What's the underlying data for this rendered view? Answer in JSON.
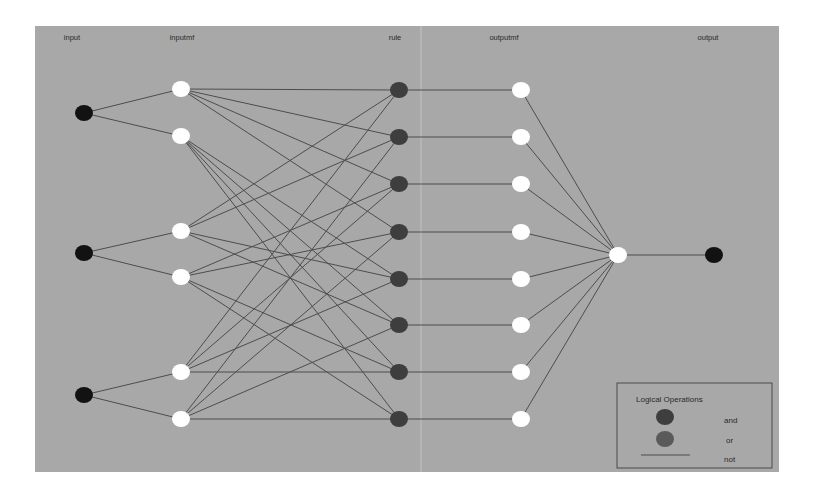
{
  "figure": {
    "background": "#ffffff",
    "panel": {
      "x": 35,
      "y": 26,
      "width": 744,
      "height": 446,
      "color": "#a8a8a8"
    },
    "edge_color": "#4d4d4d",
    "colors": {
      "input_node": "#121212",
      "mf_node": "#ffffff",
      "rule_and": "#3e3e3e",
      "rule_or": "#5a5a5a",
      "sum_node": "#ffffff",
      "output_node": "#121212"
    },
    "node_rx": 9,
    "node_ry": 8
  },
  "layers": [
    {
      "key": "input",
      "label": "input",
      "label_x": 72,
      "x": 84
    },
    {
      "key": "inputmf",
      "label": "inputmf",
      "label_x": 182,
      "x": 181
    },
    {
      "key": "rule",
      "label": "rule",
      "label_x": 395,
      "x": 399
    },
    {
      "key": "outputmf",
      "label": "outputmf",
      "label_x": 504,
      "x": 521
    },
    {
      "key": "output",
      "label": "output",
      "label_x": 708,
      "x": 714
    }
  ],
  "nodes": {
    "input": [
      {
        "id": "in1",
        "y": 113
      },
      {
        "id": "in2",
        "y": 253
      },
      {
        "id": "in3",
        "y": 395
      }
    ],
    "inputmf": [
      {
        "id": "in1mf1",
        "input": 0,
        "y": 89
      },
      {
        "id": "in1mf2",
        "input": 0,
        "y": 136
      },
      {
        "id": "in2mf1",
        "input": 1,
        "y": 231
      },
      {
        "id": "in2mf2",
        "input": 1,
        "y": 277
      },
      {
        "id": "in3mf1",
        "input": 2,
        "y": 372
      },
      {
        "id": "in3mf2",
        "input": 2,
        "y": 419
      }
    ],
    "rule": [
      {
        "id": "rule1",
        "y": 90,
        "mfs": [
          0,
          2,
          4
        ]
      },
      {
        "id": "rule2",
        "y": 137,
        "mfs": [
          0,
          2,
          5
        ]
      },
      {
        "id": "rule3",
        "y": 184,
        "mfs": [
          0,
          3,
          4
        ]
      },
      {
        "id": "rule4",
        "y": 232,
        "mfs": [
          0,
          3,
          5
        ]
      },
      {
        "id": "rule5",
        "y": 279,
        "mfs": [
          1,
          2,
          4
        ]
      },
      {
        "id": "rule6",
        "y": 325,
        "mfs": [
          1,
          2,
          5
        ]
      },
      {
        "id": "rule7",
        "y": 372,
        "mfs": [
          1,
          3,
          4
        ]
      },
      {
        "id": "rule8",
        "y": 419,
        "mfs": [
          1,
          3,
          5
        ]
      }
    ],
    "outputmf": [
      {
        "id": "outmf1",
        "y": 90
      },
      {
        "id": "outmf2",
        "y": 137
      },
      {
        "id": "outmf3",
        "y": 184
      },
      {
        "id": "outmf4",
        "y": 232
      },
      {
        "id": "outmf5",
        "y": 279
      },
      {
        "id": "outmf6",
        "y": 325
      },
      {
        "id": "outmf7",
        "y": 372
      },
      {
        "id": "outmf8",
        "y": 419
      }
    ],
    "sum": {
      "id": "aggregate",
      "x": 618,
      "y": 255
    },
    "output": {
      "id": "out1",
      "x": 714,
      "y": 255
    }
  },
  "legend": {
    "title": "Logical Operations",
    "box": {
      "x": 617,
      "y": 383,
      "width": 155,
      "height": 85
    },
    "items": [
      {
        "label": "and",
        "type": "circle",
        "color": "#3e3e3e"
      },
      {
        "label": "or",
        "type": "circle",
        "color": "#5a5a5a"
      },
      {
        "label": "not",
        "type": "line",
        "color": "#4d4d4d"
      }
    ]
  }
}
